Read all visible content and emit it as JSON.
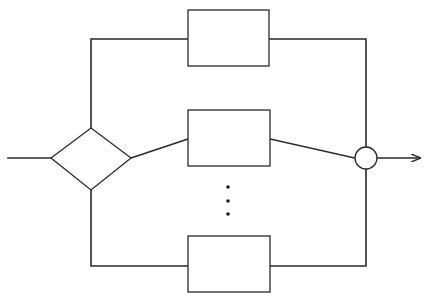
{
  "diagram": {
    "type": "parallel-branch flow diagram",
    "colors": {
      "line": "#2a2a2a",
      "background": "#ffffff"
    },
    "nodes": [
      {
        "id": "decision",
        "shape": "diamond",
        "label": ""
      },
      {
        "id": "block-top",
        "shape": "rectangle",
        "label": ""
      },
      {
        "id": "block-middle",
        "shape": "rectangle",
        "label": ""
      },
      {
        "id": "block-bottom",
        "shape": "rectangle",
        "label": ""
      },
      {
        "id": "junction",
        "shape": "circle",
        "label": ""
      }
    ],
    "ellipsis": "vertical-dots",
    "edges": [
      {
        "from": "input",
        "to": "decision"
      },
      {
        "from": "decision",
        "to": "block-top"
      },
      {
        "from": "decision",
        "to": "block-middle"
      },
      {
        "from": "decision",
        "to": "block-bottom"
      },
      {
        "from": "block-top",
        "to": "junction"
      },
      {
        "from": "block-middle",
        "to": "junction"
      },
      {
        "from": "block-bottom",
        "to": "junction"
      },
      {
        "from": "junction",
        "to": "output",
        "arrow": true
      }
    ]
  }
}
